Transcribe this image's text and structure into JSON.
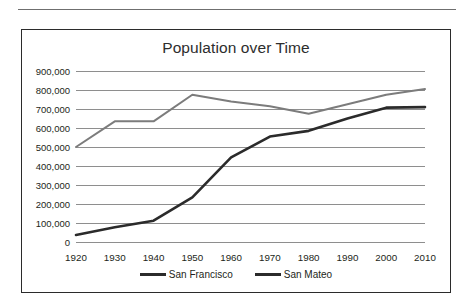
{
  "chart_data": {
    "type": "line",
    "title": "Population over Time",
    "xlabel": "",
    "ylabel": "",
    "x": [
      1920,
      1930,
      1940,
      1950,
      1960,
      1970,
      1980,
      1990,
      2000,
      2010
    ],
    "categories": [
      "1920",
      "1930",
      "1940",
      "1950",
      "1960",
      "1970",
      "1980",
      "1990",
      "2000",
      "2010"
    ],
    "series": [
      {
        "name": "San Francisco",
        "color": "#7c7c7c",
        "values": [
          500000,
          635000,
          635000,
          775000,
          740000,
          715000,
          675000,
          725000,
          775000,
          805000
        ]
      },
      {
        "name": "San Mateo",
        "color": "#2b2b2b",
        "values": [
          37000,
          78000,
          112000,
          235000,
          445000,
          555000,
          585000,
          650000,
          707000,
          710000
        ]
      }
    ],
    "ylim": [
      0,
      900000
    ],
    "ytick_step": 100000,
    "ytick_labels": [
      "900,000",
      "800,000",
      "700,000",
      "600,000",
      "500,000",
      "400,000",
      "300,000",
      "200,000",
      "100,000",
      "0"
    ],
    "ytick_values": [
      900000,
      800000,
      700000,
      600000,
      500000,
      400000,
      300000,
      200000,
      100000,
      0
    ],
    "grid": true,
    "legend_position": "bottom"
  },
  "legend": {
    "items": [
      {
        "label": "San Francisco",
        "color": "#2b2b2b"
      },
      {
        "label": "San Mateo",
        "color": "#2b2b2b"
      }
    ]
  }
}
